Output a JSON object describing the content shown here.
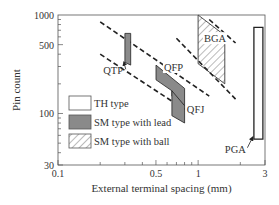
{
  "chart_data": {
    "type": "area",
    "title": "",
    "xlabel": "External terminal spacing (mm)",
    "ylabel": "Pin count",
    "xscale": "log",
    "yscale": "log",
    "xlim": [
      0.1,
      3
    ],
    "ylim": [
      30,
      1000
    ],
    "xticks": [
      {
        "value": 0.1,
        "label": "0.1"
      },
      {
        "value": 0.5,
        "label": "0.5"
      },
      {
        "value": 1,
        "label": "1"
      },
      {
        "value": 3,
        "label": "3"
      }
    ],
    "yticks": [
      {
        "value": 30,
        "label": "30"
      },
      {
        "value": 100,
        "label": "100"
      },
      {
        "value": 500,
        "label": "500"
      },
      {
        "value": 1000,
        "label": "1000"
      }
    ],
    "grid": false,
    "legend": {
      "position": "bottom-left",
      "entries": [
        {
          "label": "TH type",
          "style": "empty"
        },
        {
          "label": "SM type with lead",
          "style": "gray"
        },
        {
          "label": "SM type with ball",
          "style": "hatch"
        }
      ]
    },
    "series": [
      {
        "name": "QTP",
        "style": "gray",
        "polygon": [
          [
            0.3,
            650
          ],
          [
            0.33,
            650
          ],
          [
            0.33,
            310
          ],
          [
            0.3,
            330
          ]
        ]
      },
      {
        "name": "QFP",
        "style": "gray",
        "polygon": [
          [
            0.5,
            310
          ],
          [
            0.8,
            180
          ],
          [
            0.8,
            120
          ],
          [
            0.65,
            150
          ],
          [
            0.65,
            170
          ],
          [
            0.5,
            220
          ]
        ]
      },
      {
        "name": "QFJ",
        "style": "gray",
        "polygon": [
          [
            0.65,
            170
          ],
          [
            0.8,
            120
          ],
          [
            0.8,
            80
          ],
          [
            0.65,
            95
          ]
        ]
      },
      {
        "name": "BGA",
        "style": "hatch",
        "polygon": [
          [
            1.0,
            1000
          ],
          [
            1.55,
            620
          ],
          [
            1.55,
            200
          ],
          [
            1.0,
            320
          ]
        ]
      },
      {
        "name": "PGA",
        "style": "empty",
        "polygon": [
          [
            2.5,
            750
          ],
          [
            2.9,
            750
          ],
          [
            2.9,
            55
          ],
          [
            2.5,
            55
          ]
        ]
      }
    ],
    "trend_lines": [
      {
        "name": "upper-left-trend",
        "from": [
          0.2,
          850
        ],
        "to": [
          1.2,
          150
        ]
      },
      {
        "name": "lower-left-trend",
        "from": [
          0.2,
          400
        ],
        "to": [
          0.8,
          110
        ]
      },
      {
        "name": "upper-right-trend",
        "from": [
          1.2,
          900
        ],
        "to": [
          1.85,
          520
        ]
      },
      {
        "name": "lower-right-trend",
        "from": [
          0.7,
          580
        ],
        "to": [
          1.85,
          140
        ]
      }
    ],
    "annotations": [
      {
        "text": "QTP",
        "x": 0.21,
        "y": 250,
        "arrow_to": [
          0.3,
          335
        ]
      },
      {
        "text": "QFP",
        "x": 0.57,
        "y": 270,
        "arrow_to": null
      },
      {
        "text": "QFJ",
        "x": 0.83,
        "y": 100,
        "arrow_to": null
      },
      {
        "text": "BGA",
        "x": 1.1,
        "y": 530,
        "arrow_to": null
      },
      {
        "text": "PGA",
        "x": 1.55,
        "y": 40,
        "arrow_to": [
          2.5,
          58
        ]
      }
    ]
  }
}
